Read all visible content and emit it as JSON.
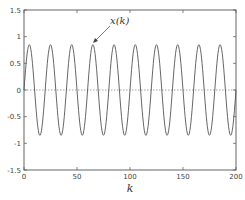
{
  "chart_data": {
    "type": "line",
    "title": "",
    "xlabel": "k",
    "ylabel": "",
    "xlim": [
      0,
      200
    ],
    "ylim": [
      -1.5,
      1.5
    ],
    "xticks": [
      0,
      50,
      100,
      150,
      200
    ],
    "xtick_labels": [
      "0",
      "50",
      "100",
      "150",
      "200"
    ],
    "yticks": [
      1.5,
      1,
      0.5,
      0,
      -0.5,
      -1,
      -1.5
    ],
    "ytick_labels": [
      "1.5",
      "1",
      "0.5",
      "0",
      "-0.5",
      "-1",
      "-1.5"
    ],
    "grid": false,
    "legend": null,
    "series": [
      {
        "name": "x(k)",
        "description": "sinusoid, amplitude ~0.85, period ~20 samples, peaks near k=5,25,...,185, troughs near k=15,35,...,195",
        "amplitude": 0.85,
        "period": 20,
        "peak_k": [
          5,
          25,
          45,
          65,
          85,
          105,
          125,
          145,
          165,
          185
        ],
        "trough_k": [
          15,
          35,
          55,
          75,
          95,
          115,
          135,
          155,
          175,
          195
        ],
        "color": "#555555"
      }
    ],
    "reference_line": {
      "y": 0,
      "style": "dotted"
    },
    "annotations": [
      {
        "text": "x(k)",
        "points_to": {
          "k": 65,
          "y": 0.85
        }
      }
    ]
  },
  "labels": {
    "xlabel": "k",
    "annotation": "x(k)",
    "xticks": [
      "0",
      "50",
      "100",
      "150",
      "200"
    ],
    "yticks": [
      "1.5",
      "1",
      "0.5",
      "0",
      "-0.5",
      "-1",
      "-1.5"
    ]
  }
}
